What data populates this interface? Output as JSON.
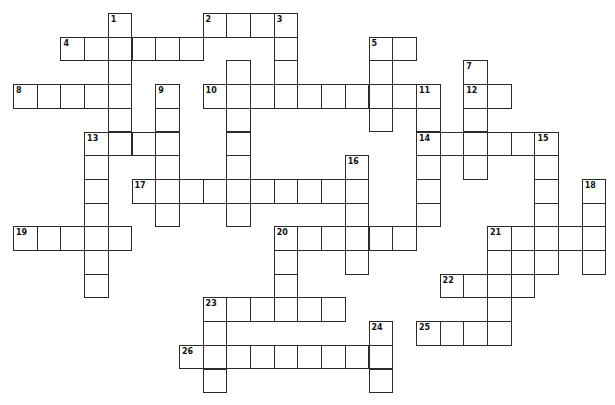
{
  "puzzle": {
    "type": "crossword",
    "grid": {
      "origin_x": 13,
      "origin_y": 13,
      "cell_size": 23.7
    },
    "colors": {
      "line": "#2b2b2b",
      "cell_bg": "#ffffff",
      "label": "#111111",
      "page_bg": "#ffffff"
    },
    "words": [
      {
        "number": "1",
        "dir": "down",
        "col": 4,
        "row": 0,
        "length": 6
      },
      {
        "number": "2",
        "dir": "across",
        "col": 8,
        "row": 0,
        "length": 4
      },
      {
        "number": "3",
        "dir": "down",
        "col": 11,
        "row": 0,
        "length": 4
      },
      {
        "number": "4",
        "dir": "across",
        "col": 2,
        "row": 1,
        "length": 6
      },
      {
        "number": "5",
        "dir": "across",
        "col": 15,
        "row": 1,
        "length": 2
      },
      {
        "number": "5",
        "dir": "down",
        "col": 15,
        "row": 1,
        "length": 4
      },
      {
        "number": "",
        "dir": "down",
        "col": 9,
        "row": 2,
        "length": 7
      },
      {
        "number": "7",
        "dir": "down",
        "col": 19,
        "row": 2,
        "length": 5
      },
      {
        "number": "8",
        "dir": "across",
        "col": 0,
        "row": 3,
        "length": 5
      },
      {
        "number": "9",
        "dir": "down",
        "col": 6,
        "row": 3,
        "length": 6
      },
      {
        "number": "10",
        "dir": "across",
        "col": 8,
        "row": 3,
        "length": 10
      },
      {
        "number": "11",
        "dir": "down",
        "col": 17,
        "row": 3,
        "length": 6
      },
      {
        "number": "12",
        "dir": "across",
        "col": 19,
        "row": 3,
        "length": 2
      },
      {
        "number": "13",
        "dir": "across",
        "col": 3,
        "row": 5,
        "length": 4
      },
      {
        "number": "13",
        "dir": "down",
        "col": 3,
        "row": 5,
        "length": 7
      },
      {
        "number": "14",
        "dir": "across",
        "col": 17,
        "row": 5,
        "length": 6
      },
      {
        "number": "15",
        "dir": "down",
        "col": 22,
        "row": 5,
        "length": 6
      },
      {
        "number": "16",
        "dir": "down",
        "col": 14,
        "row": 6,
        "length": 5
      },
      {
        "number": "17",
        "dir": "across",
        "col": 5,
        "row": 7,
        "length": 10
      },
      {
        "number": "18",
        "dir": "down",
        "col": 24,
        "row": 7,
        "length": 4
      },
      {
        "number": "19",
        "dir": "across",
        "col": 0,
        "row": 9,
        "length": 5
      },
      {
        "number": "20",
        "dir": "across",
        "col": 11,
        "row": 9,
        "length": 6
      },
      {
        "number": "20",
        "dir": "down",
        "col": 11,
        "row": 9,
        "length": 4
      },
      {
        "number": "21",
        "dir": "across",
        "col": 20,
        "row": 9,
        "length": 5
      },
      {
        "number": "21",
        "dir": "down",
        "col": 20,
        "row": 9,
        "length": 5
      },
      {
        "number": "",
        "dir": "down",
        "col": 21,
        "row": 10,
        "length": 2
      },
      {
        "number": "",
        "dir": "across",
        "col": 22,
        "row": 10,
        "length": 1
      },
      {
        "number": "22",
        "dir": "across",
        "col": 18,
        "row": 11,
        "length": 4
      },
      {
        "number": "23",
        "dir": "across",
        "col": 8,
        "row": 12,
        "length": 6
      },
      {
        "number": "23",
        "dir": "down",
        "col": 8,
        "row": 12,
        "length": 4
      },
      {
        "number": "24",
        "dir": "down",
        "col": 15,
        "row": 13,
        "length": 3
      },
      {
        "number": "25",
        "dir": "across",
        "col": 17,
        "row": 13,
        "length": 4
      },
      {
        "number": "26",
        "dir": "across",
        "col": 7,
        "row": 14,
        "length": 9
      }
    ]
  }
}
